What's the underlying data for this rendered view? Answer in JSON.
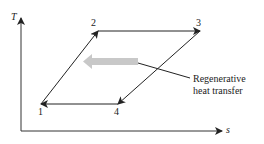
{
  "axes": {
    "y_label": "T",
    "x_label": "s"
  },
  "points": [
    {
      "id": "1",
      "label": "1"
    },
    {
      "id": "2",
      "label": "2"
    },
    {
      "id": "3",
      "label": "3"
    },
    {
      "id": "4",
      "label": "4"
    }
  ],
  "annotation": {
    "line1": "Regenerative",
    "line2": "heat transfer"
  },
  "colors": {
    "line": "#222222",
    "regen_arrow": "#c8c8c8"
  }
}
